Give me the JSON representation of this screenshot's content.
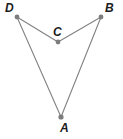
{
  "figure": {
    "width": 123,
    "height": 139,
    "background_color": "#ffffff",
    "line_color": "#828282",
    "dot_color": "#7d7d7d",
    "label_color": "#1c1c1c"
  },
  "points": [
    {
      "id": "D",
      "label": "D",
      "x": 17,
      "y": 17,
      "label_x": 5,
      "label_y": 2,
      "dot_r": 2.4
    },
    {
      "id": "B",
      "label": "B",
      "x": 101,
      "y": 17,
      "label_x": 105,
      "label_y": 2,
      "dot_r": 2.4
    },
    {
      "id": "C",
      "label": "C",
      "x": 58,
      "y": 42,
      "label_x": 53,
      "label_y": 26,
      "dot_r": 2.4
    },
    {
      "id": "A",
      "label": "A",
      "x": 61,
      "y": 117,
      "label_x": 60,
      "label_y": 122,
      "dot_r": 2.6
    }
  ],
  "edges": [
    {
      "id": "edge-D-C",
      "from": "D",
      "to": "C",
      "x1": 17,
      "y1": 17,
      "x2": 58,
      "y2": 42
    },
    {
      "id": "edge-C-B",
      "from": "C",
      "to": "B",
      "x1": 58,
      "y1": 42,
      "x2": 101,
      "y2": 17
    },
    {
      "id": "edge-D-A",
      "from": "D",
      "to": "A",
      "x1": 17,
      "y1": 17,
      "x2": 61,
      "y2": 117
    },
    {
      "id": "edge-B-A",
      "from": "B",
      "to": "A",
      "x1": 101,
      "y1": 17,
      "x2": 61,
      "y2": 117
    }
  ]
}
